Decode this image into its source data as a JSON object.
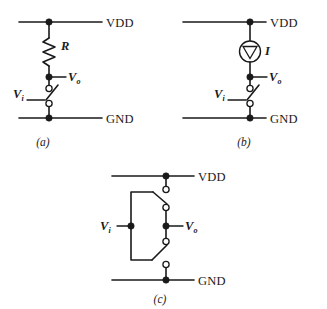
{
  "figure": {
    "type": "circuit-schematic-figure",
    "panel_count": 3,
    "labels": {
      "vdd": "VDD",
      "gnd": "GND",
      "v_symbol": "V",
      "sub_in": "i",
      "sub_out": "o",
      "resistor": "R",
      "current": "I",
      "caption_a": "(a)",
      "caption_b": "(b)",
      "caption_c": "(c)"
    },
    "colors": {
      "ink": "#1a1a1a",
      "paper": "#ffffff",
      "node_fill": "#1a1a1a",
      "terminal_fill": "#ffffff"
    },
    "panels": [
      {
        "id": "a",
        "caption": "(a)",
        "description": "Resistive pull-up with single switch to ground",
        "elements": [
          {
            "name": "vdd-rail",
            "label": "VDD"
          },
          {
            "name": "resistor",
            "label": "R"
          },
          {
            "name": "output-node",
            "label": "V",
            "sub": "o"
          },
          {
            "name": "input-switch",
            "label": "V",
            "sub": "i"
          },
          {
            "name": "gnd-rail",
            "label": "GND"
          }
        ]
      },
      {
        "id": "b",
        "caption": "(b)",
        "description": "Current-source pull-up with single switch to ground",
        "elements": [
          {
            "name": "vdd-rail",
            "label": "VDD"
          },
          {
            "name": "current-source",
            "label": "I"
          },
          {
            "name": "output-node",
            "label": "V",
            "sub": "o"
          },
          {
            "name": "input-switch",
            "label": "V",
            "sub": "i"
          },
          {
            "name": "gnd-rail",
            "label": "GND"
          }
        ]
      },
      {
        "id": "c",
        "caption": "(c)",
        "description": "Complementary pair of switches between VDD and GND driven by a common input",
        "elements": [
          {
            "name": "vdd-rail",
            "label": "VDD"
          },
          {
            "name": "pull-up-switch",
            "label": ""
          },
          {
            "name": "input-node",
            "label": "V",
            "sub": "i"
          },
          {
            "name": "output-node",
            "label": "V",
            "sub": "o"
          },
          {
            "name": "pull-down-switch",
            "label": ""
          },
          {
            "name": "gnd-rail",
            "label": "GND"
          }
        ]
      }
    ]
  }
}
